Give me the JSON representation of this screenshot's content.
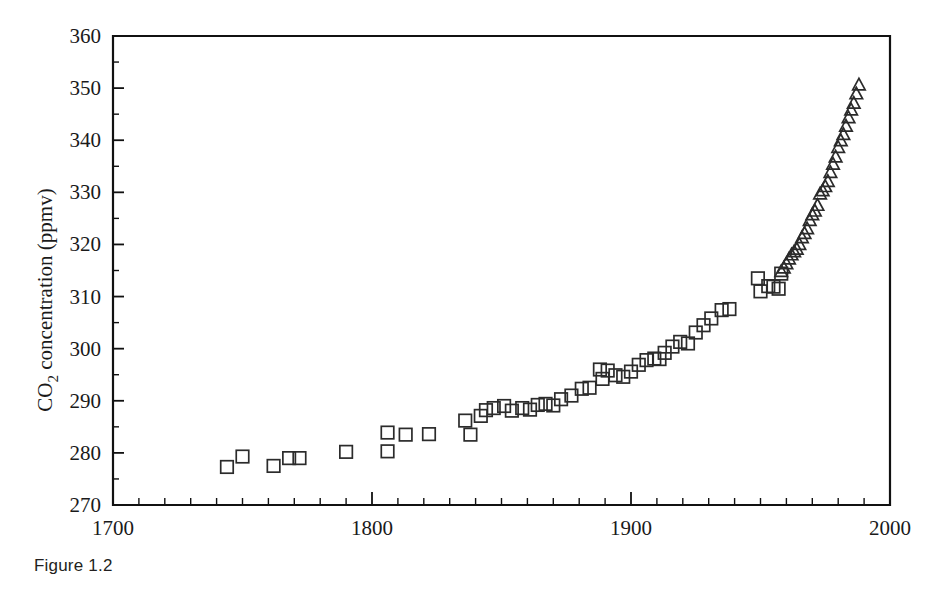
{
  "caption": "Figure 1.2",
  "chart_data": {
    "type": "scatter",
    "title": "",
    "xlabel": "",
    "ylabel": "CO2 concentration (ppmv)",
    "ylabel_parts": {
      "pre": "CO",
      "sub": "2",
      "post": " concentration (ppmv)"
    },
    "xlim": [
      1700,
      2000
    ],
    "ylim": [
      270,
      360
    ],
    "grid": false,
    "legend": "none",
    "x_ticks_major": [
      1700,
      1800,
      1900,
      2000
    ],
    "x_tick_labels": [
      "1700",
      "1800",
      "1900",
      "2000"
    ],
    "x_tick_minor_step": 10,
    "y_ticks_major": [
      270,
      280,
      290,
      300,
      310,
      320,
      330,
      340,
      350,
      360
    ],
    "y_tick_labels": [
      "270",
      "280",
      "290",
      "300",
      "310",
      "320",
      "330",
      "340",
      "350",
      "360"
    ],
    "y_tick_minor_step": 5,
    "series": [
      {
        "name": "Ice core record",
        "marker": "square",
        "points": [
          [
            1744,
            277.3
          ],
          [
            1750,
            279.3
          ],
          [
            1762,
            277.5
          ],
          [
            1768,
            279.0
          ],
          [
            1772,
            279.0
          ],
          [
            1790,
            280.2
          ],
          [
            1806,
            283.9
          ],
          [
            1806,
            280.3
          ],
          [
            1813,
            283.5
          ],
          [
            1822,
            283.6
          ],
          [
            1836,
            286.2
          ],
          [
            1838,
            283.5
          ],
          [
            1842,
            287.1
          ],
          [
            1844,
            288.2
          ],
          [
            1847,
            288.6
          ],
          [
            1851,
            289.0
          ],
          [
            1854,
            288.1
          ],
          [
            1858,
            288.6
          ],
          [
            1861,
            288.3
          ],
          [
            1864,
            289.2
          ],
          [
            1867,
            289.4
          ],
          [
            1870,
            289.1
          ],
          [
            1873,
            290.3
          ],
          [
            1877,
            291.0
          ],
          [
            1881,
            292.3
          ],
          [
            1884,
            292.5
          ],
          [
            1888,
            296.0
          ],
          [
            1889,
            294.2
          ],
          [
            1891,
            295.8
          ],
          [
            1894,
            294.9
          ],
          [
            1897,
            294.6
          ],
          [
            1900,
            295.6
          ],
          [
            1903,
            296.9
          ],
          [
            1906,
            297.8
          ],
          [
            1909,
            298.1
          ],
          [
            1911,
            298.0
          ],
          [
            1913,
            299.2
          ],
          [
            1916,
            300.4
          ],
          [
            1919,
            301.3
          ],
          [
            1922,
            301.0
          ],
          [
            1925,
            303.1
          ],
          [
            1928,
            304.5
          ],
          [
            1931,
            305.8
          ],
          [
            1935,
            307.4
          ],
          [
            1938,
            307.6
          ],
          [
            1949,
            313.5
          ],
          [
            1950,
            311.0
          ],
          [
            1953,
            312.0
          ],
          [
            1955,
            311.9
          ],
          [
            1957,
            311.5
          ],
          [
            1958,
            314.4
          ]
        ]
      },
      {
        "name": "Mauna Loa atmospheric record",
        "marker": "triangle",
        "points": [
          [
            1958,
            314.7
          ],
          [
            1959,
            315.4
          ],
          [
            1960,
            316.2
          ],
          [
            1961,
            317.1
          ],
          [
            1962,
            317.9
          ],
          [
            1963,
            318.5
          ],
          [
            1964,
            319.0
          ],
          [
            1965,
            319.9
          ],
          [
            1966,
            321.2
          ],
          [
            1967,
            322.0
          ],
          [
            1968,
            322.9
          ],
          [
            1969,
            324.5
          ],
          [
            1970,
            325.6
          ],
          [
            1971,
            326.3
          ],
          [
            1972,
            327.4
          ],
          [
            1973,
            329.6
          ],
          [
            1974,
            330.2
          ],
          [
            1975,
            331.0
          ],
          [
            1976,
            332.0
          ],
          [
            1977,
            333.7
          ],
          [
            1978,
            335.3
          ],
          [
            1979,
            336.7
          ],
          [
            1980,
            338.5
          ],
          [
            1981,
            339.8
          ],
          [
            1982,
            341.0
          ],
          [
            1983,
            342.6
          ],
          [
            1984,
            344.2
          ],
          [
            1985,
            345.7
          ],
          [
            1986,
            347.0
          ],
          [
            1987,
            348.8
          ],
          [
            1988,
            350.5
          ]
        ]
      }
    ]
  }
}
